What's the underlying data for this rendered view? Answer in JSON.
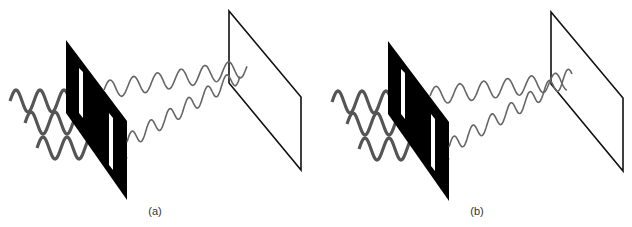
{
  "figure": {
    "panels": [
      {
        "id": "a",
        "label": "(a)",
        "description": "Double slit with wider slit separation; waves from two slits meet at screen"
      },
      {
        "id": "b",
        "label": "(b)",
        "description": "Double slit; waves from two slits cross before screen"
      }
    ],
    "colors": {
      "barrier": "#000000",
      "screen": "#111111",
      "incident_wave": "#555555",
      "diffracted_wave": "#666666"
    }
  }
}
